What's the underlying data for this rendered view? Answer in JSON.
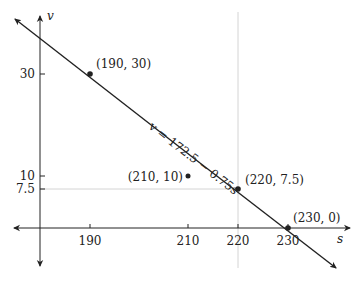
{
  "diagram": {
    "type": "line_graph",
    "axes": {
      "x_label": "s",
      "y_label": "v",
      "x_ticks": [
        "190",
        "210",
        "220",
        "230"
      ],
      "y_ticks": [
        "30",
        "10",
        "7.5"
      ]
    },
    "line": {
      "equation": "v = 172.5 − 0.75s",
      "color": "#222222"
    },
    "points": [
      {
        "label": "(190, 30)",
        "s": 190,
        "v": 30,
        "on_line": true
      },
      {
        "label": "(210, 10)",
        "s": 210,
        "v": 10,
        "on_line": false
      },
      {
        "label": "(220, 7.5)",
        "s": 220,
        "v": 7.5,
        "on_line": true
      },
      {
        "label": "(230, 0)",
        "s": 230,
        "v": 0,
        "on_line": true
      }
    ],
    "guides": {
      "vertical_at_s": 220,
      "horizontal_at_v": 7.5,
      "color": "#cfcfcf"
    }
  }
}
